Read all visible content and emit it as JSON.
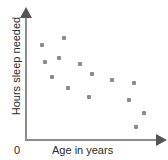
{
  "figure": {
    "width": 168,
    "height": 160,
    "background": "#ffffff",
    "axis_color": "#8c8c8c",
    "arrow_color": "#555555",
    "point_color": "#8a8a8a",
    "text_color": "#2b2b2b"
  },
  "axes": {
    "y_label": "Hours sleep needed",
    "x_label": "Age in years",
    "origin_label": "0",
    "y_arrow_icon": "arrow-up-icon",
    "x_arrow_icon": "arrow-right-icon"
  },
  "chart_data": {
    "type": "scatter",
    "title": "",
    "xlabel": "Age in years",
    "ylabel": "Hours sleep needed",
    "grid": false,
    "legend": false,
    "axis_style": "arrow-axes-unlabeled-ticks",
    "xlim": [
      0,
      100
    ],
    "ylim": [
      0,
      100
    ],
    "points_px": [
      {
        "x": 42,
        "y": 45
      },
      {
        "x": 64,
        "y": 38
      },
      {
        "x": 45,
        "y": 62
      },
      {
        "x": 59,
        "y": 58
      },
      {
        "x": 80,
        "y": 64
      },
      {
        "x": 52,
        "y": 77
      },
      {
        "x": 92,
        "y": 74
      },
      {
        "x": 68,
        "y": 88
      },
      {
        "x": 112,
        "y": 80
      },
      {
        "x": 89,
        "y": 97
      },
      {
        "x": 134,
        "y": 83
      },
      {
        "x": 129,
        "y": 100
      },
      {
        "x": 144,
        "y": 113
      },
      {
        "x": 136,
        "y": 127
      }
    ],
    "x": [
      13,
      29,
      15,
      25,
      41,
      20,
      50,
      32,
      65,
      48,
      81,
      78,
      89,
      83
    ],
    "y": [
      77,
      83,
      63,
      66,
      62,
      51,
      53,
      42,
      48,
      35,
      46,
      32,
      22,
      11
    ]
  }
}
